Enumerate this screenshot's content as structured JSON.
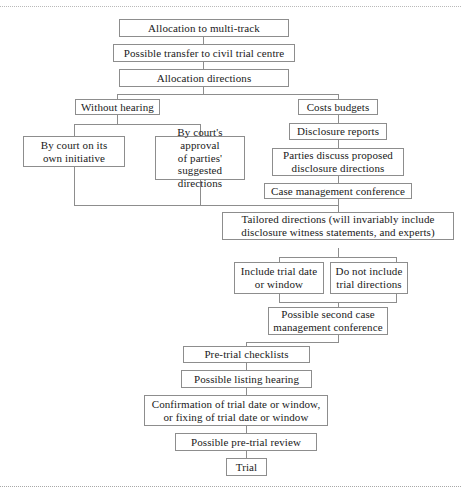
{
  "document": {
    "type": "flowchart",
    "title": "Multi-track case management flowchart",
    "rules": {
      "top_label": "top-dotted-rule",
      "bottom_label": "bottom-dotted-rule"
    },
    "colors": {
      "box_border": "#8d8d8d",
      "connector": "#8d8d8d",
      "text": "#1a1a1a",
      "background": "#ffffff",
      "rule": "#b9b9b9"
    }
  },
  "nodes": {
    "allocation_multi_track": "Allocation to multi-track",
    "possible_transfer": "Possible transfer to civil trial centre",
    "allocation_directions": "Allocation directions",
    "without_hearing": "Without hearing",
    "costs_budgets": "Costs budgets",
    "by_court_initiative_l1": "By court on its",
    "by_court_initiative_l2": "own initiative",
    "court_approval_l1": "By court's approval",
    "court_approval_l2": "of parties' suggested",
    "court_approval_l3": "directions",
    "disclosure_reports": "Disclosure reports",
    "parties_discuss_l1": "Parties discuss proposed",
    "parties_discuss_l2": "disclosure directions",
    "case_management_conference": "Case management conference",
    "tailored_directions_l1": "Tailored directions (will invariably include",
    "tailored_directions_l2": "disclosure witness statements, and experts)",
    "include_trial_date_l1": "Include trial date",
    "include_trial_date_l2": "or window",
    "do_not_include_l1": "Do not include",
    "do_not_include_l2": "trial directions",
    "possible_second_cmc_l1": "Possible second case",
    "possible_second_cmc_l2": "management conference",
    "pre_trial_checklists": "Pre-trial checklists",
    "possible_listing_hearing": "Possible listing hearing",
    "confirmation_l1": "Confirmation of trial date or window,",
    "confirmation_l2": "or fixing of trial date or window",
    "possible_pre_trial_review": "Possible pre-trial review",
    "trial": "Trial"
  }
}
